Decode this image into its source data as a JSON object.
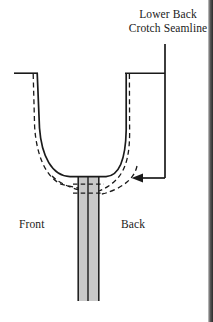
{
  "figure": {
    "type": "technical-sewing-pattern-diagram",
    "background_color": "#ffffff",
    "ink_color": "#1a1a1a"
  },
  "labels": {
    "callout_line1": "Lower Back",
    "callout_line2": "Crotch Seamline",
    "front": "Front",
    "back": "Back"
  },
  "annotations": {
    "leader": {
      "name": "callout-leader-line",
      "description": "vertical line descending from label to arrowhead",
      "vertical_x": 165,
      "top_y": 44,
      "bottom_y": 178
    },
    "arrow": {
      "name": "leader-arrowhead",
      "direction": "left",
      "tip_x": 133,
      "tip_y": 178
    }
  },
  "geometry": {
    "solid_curve": {
      "name": "original-crotch-seamline",
      "style": "solid",
      "stroke_width": 1.6,
      "left_top": [
        37,
        73
      ],
      "right_top": [
        126,
        73
      ],
      "bottom_y": 176
    },
    "dashed_curve": {
      "name": "lowered-crotch-seamline",
      "style": "dashed",
      "stroke_width": 1.3,
      "dash_pattern": "5,3",
      "left_top": [
        33,
        73
      ],
      "right_top": [
        129,
        73
      ]
    },
    "top_rails": [
      {
        "name": "left-waist-rail",
        "x1": 14,
        "x2": 38,
        "y": 73
      },
      {
        "name": "right-waist-rail",
        "x1": 125,
        "x2": 165,
        "y": 73
      }
    ],
    "inseam_column": {
      "name": "inseam-shaded-column",
      "left_x": 77,
      "right_x": 99,
      "center_x": 88,
      "top_y": 176,
      "bottom_y": 301,
      "fill": "#c9c9c9"
    },
    "crossing_dashes": [
      {
        "name": "upper-crossing-dash",
        "y": 183
      },
      {
        "name": "lower-crossing-dash",
        "y": 192
      }
    ]
  },
  "scan_edge": {
    "name": "page-scan-edge",
    "present": true,
    "side": "right",
    "color": "#2a2a2a"
  }
}
